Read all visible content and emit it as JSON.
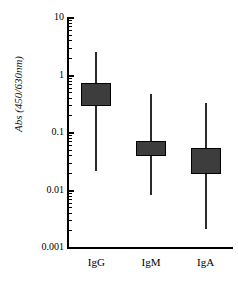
{
  "chart_data": {
    "type": "box",
    "title": "",
    "xlabel": "",
    "ylabel": "Abs (450/630nm)",
    "yscale": "log",
    "ylim": [
      0.001,
      10
    ],
    "ytick_labels": [
      "10",
      "1",
      "0.1",
      "0.01",
      "0.001"
    ],
    "ytick_values": [
      10,
      1,
      0.1,
      0.01,
      0.001
    ],
    "grid": false,
    "legend": false,
    "categories": [
      "IgG",
      "IgM",
      "IgA"
    ],
    "series": [
      {
        "name": "IgG",
        "whisker_high": 2.6,
        "box_high": 0.75,
        "box_low": 0.29,
        "whisker_low": 0.022
      },
      {
        "name": "IgM",
        "whisker_high": 0.47,
        "box_high": 0.073,
        "box_low": 0.04,
        "whisker_low": 0.0085
      },
      {
        "name": "IgA",
        "whisker_high": 0.33,
        "box_high": 0.054,
        "box_low": 0.019,
        "whisker_low": 0.0021
      }
    ],
    "colors": {
      "box_fill": "#3d3d3d",
      "box_edge": "#000000",
      "whisker": "#2b2b2b",
      "axis": "#000000",
      "background": "#ffffff"
    }
  }
}
